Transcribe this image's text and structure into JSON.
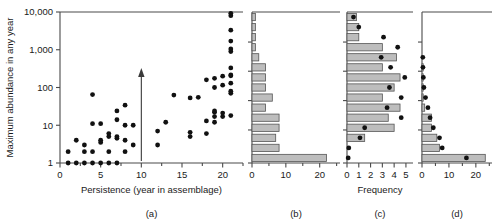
{
  "figure": {
    "y_axis_label": "Maximum abundance in any year",
    "y_ticks": [
      "1",
      "10",
      "100",
      "1,000",
      "10,000"
    ],
    "y_tick_values": [
      1,
      10,
      100,
      1000,
      10000
    ],
    "y_scale": "log",
    "y_range": [
      1,
      10000
    ]
  },
  "panels": {
    "a": {
      "label": "(a)",
      "x_axis_label": "Persistence (year in assemblage)",
      "x_ticks": [
        "0",
        "5",
        "10",
        "15",
        "20"
      ],
      "x_tick_values": [
        0,
        5,
        10,
        15,
        20
      ],
      "x_minor_ticks": [
        2.5,
        7.5,
        12.5,
        17.5,
        22.5
      ],
      "x_range": [
        0,
        22.5
      ],
      "annotation": "vertical-arrow-at-x-10"
    },
    "b": {
      "label": "(b)",
      "x_ticks": [
        "0",
        "10",
        "20"
      ],
      "x_tick_values": [
        0,
        10,
        20
      ],
      "x_minor_ticks": [
        5,
        15,
        25
      ],
      "x_range": [
        0,
        26
      ]
    },
    "c": {
      "label": "(c)",
      "x_axis_label": "Frequency",
      "x_ticks": [
        "0",
        "1",
        "2",
        "3",
        "4",
        "5"
      ],
      "x_tick_values": [
        0,
        1,
        2,
        3,
        4,
        5
      ],
      "x_range": [
        0,
        5.6
      ]
    },
    "d": {
      "label": "(d)",
      "x_ticks": [
        "0",
        "10",
        "20"
      ],
      "x_tick_values": [
        0,
        10,
        20
      ],
      "x_minor_ticks": [
        5,
        15,
        25
      ],
      "x_range": [
        0,
        26
      ]
    }
  },
  "chart_data": [
    {
      "id": "panel-a",
      "type": "scatter",
      "title": "",
      "xlabel": "Persistence (year in assemblage)",
      "ylabel": "Maximum abundance in any year",
      "xlim": [
        0,
        22.5
      ],
      "ylim": [
        1,
        10000
      ],
      "yscale": "log",
      "grid": false,
      "legend": "none",
      "points": [
        [
          1,
          1
        ],
        [
          2,
          1
        ],
        [
          3,
          1
        ],
        [
          4,
          1
        ],
        [
          5,
          1
        ],
        [
          6,
          1
        ],
        [
          7,
          1
        ],
        [
          1,
          2
        ],
        [
          3,
          2
        ],
        [
          4,
          2
        ],
        [
          6,
          2
        ],
        [
          8,
          2
        ],
        [
          2,
          4
        ],
        [
          3,
          3
        ],
        [
          5,
          3.5
        ],
        [
          5,
          4
        ],
        [
          6,
          5
        ],
        [
          6,
          6
        ],
        [
          7,
          4.5
        ],
        [
          7,
          5
        ],
        [
          8,
          4
        ],
        [
          8,
          10
        ],
        [
          9,
          3
        ],
        [
          9,
          10
        ],
        [
          4,
          11
        ],
        [
          5,
          11
        ],
        [
          7,
          14
        ],
        [
          8,
          34
        ],
        [
          7,
          24
        ],
        [
          4,
          65
        ],
        [
          12,
          3
        ],
        [
          12,
          7
        ],
        [
          13,
          12
        ],
        [
          14,
          63
        ],
        [
          16,
          5
        ],
        [
          16,
          6.5
        ],
        [
          16,
          53
        ],
        [
          17,
          55
        ],
        [
          18,
          6
        ],
        [
          18,
          13
        ],
        [
          18,
          160
        ],
        [
          19,
          12
        ],
        [
          19,
          17
        ],
        [
          19,
          22
        ],
        [
          19,
          24
        ],
        [
          19,
          100
        ],
        [
          19,
          175
        ],
        [
          20,
          17
        ],
        [
          20,
          21
        ],
        [
          20,
          115
        ],
        [
          20,
          200
        ],
        [
          21,
          18
        ],
        [
          21,
          70
        ],
        [
          21,
          80
        ],
        [
          21,
          130
        ],
        [
          21,
          205
        ],
        [
          21,
          215
        ],
        [
          21,
          330
        ],
        [
          21,
          900
        ],
        [
          21,
          1050
        ],
        [
          21,
          1700
        ],
        [
          21,
          3300
        ],
        [
          21,
          8000
        ],
        [
          21,
          9200
        ]
      ]
    },
    {
      "id": "panel-b",
      "type": "bar",
      "orientation": "horizontal",
      "title": "",
      "xlabel": "",
      "ylabel": "Maximum abundance in any year",
      "xlim": [
        0,
        26
      ],
      "ylim": [
        1,
        10000
      ],
      "yscale": "log",
      "grid": false,
      "legend": "none",
      "bin_centers": [
        1,
        2,
        4,
        7.5,
        14,
        25,
        45,
        85,
        150,
        270,
        500,
        900,
        1600,
        3000,
        5500
      ],
      "values": [
        22,
        8,
        7,
        8,
        8,
        4,
        6,
        4,
        4,
        4,
        2,
        1,
        1,
        1,
        1
      ]
    },
    {
      "id": "panel-c",
      "type": "bar",
      "orientation": "horizontal",
      "title": "",
      "xlabel": "Frequency",
      "ylabel": "Maximum abundance in any year",
      "xlim": [
        0,
        5.6
      ],
      "ylim": [
        1,
        10000
      ],
      "yscale": "log",
      "grid": false,
      "legend": "none",
      "bin_centers": [
        1,
        2,
        4,
        7.5,
        14,
        25,
        45,
        85,
        150,
        270,
        500,
        900,
        1600,
        3000,
        5500
      ],
      "values": [
        0,
        0,
        1.5,
        4,
        3.5,
        4.5,
        3,
        4,
        4.5,
        3,
        4.2,
        3,
        1,
        1,
        0.8
      ],
      "overlay_points": [
        [
          0.1,
          1
        ],
        [
          0.15,
          2
        ],
        [
          1.1,
          4
        ],
        [
          1.5,
          7.5
        ],
        [
          4.6,
          14
        ],
        [
          3.4,
          25
        ],
        [
          4.6,
          45
        ],
        [
          3.6,
          85
        ],
        [
          4.9,
          150
        ],
        [
          3.7,
          270
        ],
        [
          2.9,
          500
        ],
        [
          4.3,
          900
        ],
        [
          3.1,
          1600
        ],
        [
          1.0,
          3000
        ],
        [
          0.55,
          5500
        ]
      ]
    },
    {
      "id": "panel-d",
      "type": "bar",
      "orientation": "horizontal",
      "title": "",
      "xlabel": "",
      "ylabel": "Maximum abundance in any year",
      "xlim": [
        0,
        26
      ],
      "ylim": [
        1,
        10000
      ],
      "yscale": "log",
      "grid": false,
      "legend": "none",
      "bin_centers": [
        1,
        2,
        4,
        7.5,
        14,
        25,
        45,
        85,
        150,
        270,
        500,
        900,
        1600,
        3000,
        5500
      ],
      "values": [
        23.5,
        6.5,
        5.5,
        3.5,
        3.5,
        1.0,
        0.4,
        0.3,
        0.3,
        0.2,
        0,
        0,
        0,
        0,
        0
      ],
      "overlay_points": [
        [
          16.5,
          1
        ],
        [
          7.5,
          2
        ],
        [
          6.5,
          4
        ],
        [
          4.2,
          7.5
        ],
        [
          3.0,
          14
        ],
        [
          2.2,
          25
        ],
        [
          1.3,
          45
        ],
        [
          0.7,
          85
        ],
        [
          0.5,
          150
        ],
        [
          0.35,
          270
        ],
        [
          0.3,
          500
        ]
      ]
    }
  ]
}
